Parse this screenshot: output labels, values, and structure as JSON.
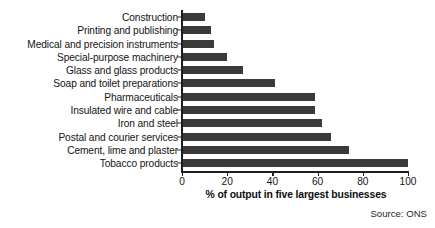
{
  "chart_data": {
    "type": "bar",
    "orientation": "horizontal",
    "title": "",
    "xlabel": "% of output in five largest businesses",
    "ylabel": "",
    "xlim": [
      0,
      100
    ],
    "xticks": [
      0,
      20,
      40,
      60,
      80,
      100
    ],
    "grid": false,
    "legend": null,
    "bar_color": "#3a3a3a",
    "background_color": "#ffffff",
    "axis_color": "#1f1f1f",
    "categories": [
      "Construction",
      "Printing and publishing",
      "Medical and precision instruments",
      "Special-purpose machinery",
      "Glass and glass products",
      "Soap and toilet preparations",
      "Pharmaceuticals",
      "Insulated wire and cable",
      "Iron and steel",
      "Postal and courier services",
      "Cement, lime and plaster",
      "Tobacco products"
    ],
    "values": [
      10,
      13,
      14,
      20,
      27,
      41,
      59,
      59,
      62,
      66,
      74,
      100
    ]
  },
  "source": {
    "note": "Source: ONS"
  }
}
